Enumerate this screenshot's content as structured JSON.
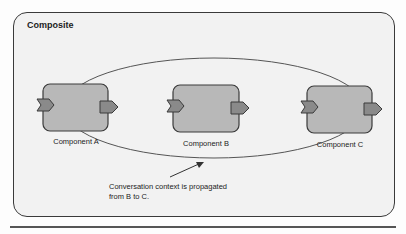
{
  "composite": {
    "title": "Composite"
  },
  "components": [
    {
      "label": "Component A"
    },
    {
      "label": "Component B"
    },
    {
      "label": "Component C"
    }
  ],
  "note": {
    "line1": "Conversation context is propagated",
    "line2": "from B to C."
  },
  "colors": {
    "component_fill": "#b8b8b8",
    "port_fill": "#8a8a8a",
    "composite_fill": "#f2f2f2",
    "stroke": "#3a3a3a"
  }
}
